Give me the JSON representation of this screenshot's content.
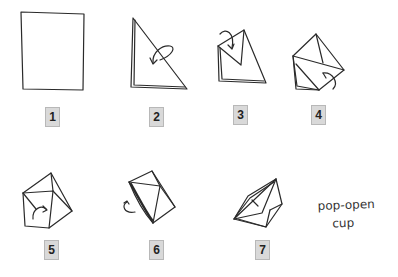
{
  "diagram": {
    "steps": [
      {
        "number": "1",
        "description": "square paper"
      },
      {
        "number": "2",
        "description": "fold diagonally into triangle"
      },
      {
        "number": "3",
        "description": "fold top corner down"
      },
      {
        "number": "4",
        "description": "fold right corner over"
      },
      {
        "number": "5",
        "description": "fold left flap across"
      },
      {
        "number": "6",
        "description": "turn over"
      },
      {
        "number": "7",
        "description": "finished cup"
      }
    ],
    "caption": {
      "line1": "pop-open",
      "line2": "cup"
    }
  }
}
